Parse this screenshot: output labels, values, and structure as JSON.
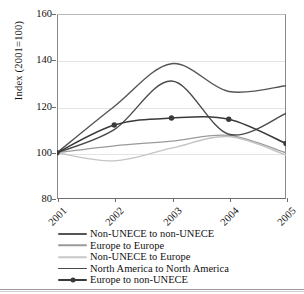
{
  "chart_data": {
    "type": "line",
    "title": "",
    "xlabel": "",
    "ylabel": "Index (2001=100)",
    "categories": [
      "2001",
      "2002",
      "2003",
      "2004",
      "2005"
    ],
    "x": [
      2001,
      2002,
      2003,
      2004,
      2005
    ],
    "xlim": [
      2001,
      2005
    ],
    "ylim": [
      80,
      160
    ],
    "yticks": [
      80,
      100,
      120,
      140,
      160
    ],
    "xticks": [
      "2001",
      "2002",
      "2003",
      "2004",
      "2005"
    ],
    "grid": "horizontal",
    "legend_position": "bottom",
    "smoothed": true,
    "series": [
      {
        "name": "Non-UNECE to non-UNECE",
        "values": [
          100,
          120,
          138.5,
          126.5,
          129
        ],
        "color": "#555555",
        "width": 1.4,
        "markers": false
      },
      {
        "name": "Europe to Europe",
        "values": [
          100,
          103,
          105,
          107.5,
          100
        ],
        "color": "#9a9a9a",
        "width": 1.2,
        "markers": false
      },
      {
        "name": "Non-UNECE to Europe",
        "values": [
          100,
          96.5,
          102,
          107,
          99
        ],
        "color": "#c4c4c4",
        "width": 1.4,
        "markers": false
      },
      {
        "name": "North America to North America",
        "values": [
          100,
          110,
          131,
          108,
          117
        ],
        "color": "#4a4a4a",
        "width": 1.4,
        "markers": false
      },
      {
        "name": "Europe to non-UNECE",
        "values": [
          100,
          112,
          115,
          114.5,
          104
        ],
        "color": "#3a3a3a",
        "width": 1.5,
        "markers": true
      }
    ]
  },
  "axis": {
    "y_title": "Index (2001=100)",
    "y_tick_labels": [
      "160",
      "140",
      "120",
      "100",
      "80"
    ],
    "x_tick_labels": [
      "2001",
      "2002",
      "2003",
      "2004",
      "2005"
    ]
  },
  "legend": {
    "items": [
      {
        "label": "Non-UNECE to non-UNECE",
        "color": "#555555",
        "width": 1.8,
        "marker": false
      },
      {
        "label": "Europe to Europe",
        "color": "#9a9a9a",
        "width": 1.4,
        "marker": false
      },
      {
        "label": "Non-UNECE to Europe",
        "color": "#c8c8c8",
        "width": 1.6,
        "marker": false
      },
      {
        "label": "North America to North America",
        "color": "#4a4a4a",
        "width": 1.8,
        "marker": false
      },
      {
        "label": "Europe to non-UNECE",
        "color": "#3a3a3a",
        "width": 1.8,
        "marker": true
      }
    ]
  }
}
